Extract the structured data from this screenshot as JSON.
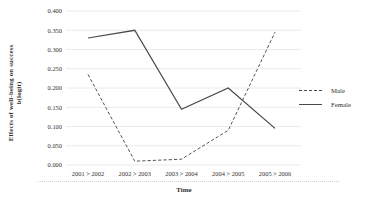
{
  "figure": {
    "y_axis_title_line1": "Effects of well-being on success",
    "y_axis_title_line2": "b(logit)",
    "x_axis_title": "Time",
    "legend": [
      {
        "label": "Male",
        "style": "dashed"
      },
      {
        "label": "Female",
        "style": "solid"
      }
    ],
    "text_color": "#33302c",
    "line_color": "#4a4a4a",
    "grid_color": "#e9e5e1"
  },
  "chart_data": {
    "type": "line",
    "title": "",
    "xlabel": "Time",
    "ylabel": "Effects of well-being on success b(logit)",
    "categories": [
      "2001 > 2002",
      "2002 > 2003",
      "2003 > 2004",
      "2004 > 2005",
      "2005 > 2006"
    ],
    "series": [
      {
        "name": "Male",
        "style": "dashed",
        "values": [
          0.235,
          0.01,
          0.015,
          0.09,
          0.345
        ]
      },
      {
        "name": "Female",
        "style": "solid",
        "values": [
          0.33,
          0.35,
          0.145,
          0.2,
          0.095
        ]
      }
    ],
    "ylim": [
      0.0,
      0.4
    ],
    "ytick_step": 0.05,
    "ytick_labels": [
      "0.000",
      "0.050",
      "0.100",
      "0.150",
      "0.200",
      "0.250",
      "0.300",
      "0.350",
      "0.400"
    ],
    "grid": true,
    "legend_position": "right-outside"
  }
}
